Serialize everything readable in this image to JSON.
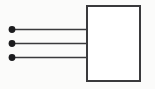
{
  "diagram": {
    "type": "line-diagram",
    "canvas": {
      "width": 155,
      "height": 89,
      "background": "#fbfbfa"
    },
    "colors": {
      "stroke": "#3a3a3c",
      "terminal_fill": "#1c1c1e",
      "box_fill": "#ffffff",
      "box_stroke": "#3a3a3c"
    },
    "box": {
      "label": "",
      "x": 86,
      "y": 5,
      "width": 55,
      "height": 77,
      "stroke_width": 2
    },
    "terminals": [
      {
        "name": "terminal-1",
        "cx": 12,
        "cy": 29.5,
        "r": 3.4,
        "label": ""
      },
      {
        "name": "terminal-2",
        "cx": 12,
        "cy": 43.5,
        "r": 3.4,
        "label": ""
      },
      {
        "name": "terminal-3",
        "cx": 12,
        "cy": 57.5,
        "r": 3.4,
        "label": ""
      }
    ],
    "connectors": [
      {
        "name": "connector-1",
        "x1": 12,
        "y1": 29.5,
        "x2": 86,
        "y2": 29.5,
        "stroke_width": 1.6
      },
      {
        "name": "connector-2",
        "x1": 12,
        "y1": 43.5,
        "x2": 86,
        "y2": 43.5,
        "stroke_width": 1.6
      },
      {
        "name": "connector-3",
        "x1": 12,
        "y1": 57.5,
        "x2": 86,
        "y2": 57.5,
        "stroke_width": 1.6
      }
    ]
  }
}
